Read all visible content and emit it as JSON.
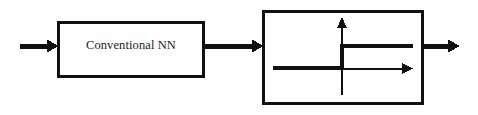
{
  "diagram": {
    "type": "block-diagram",
    "canvas": {
      "width": 478,
      "height": 115,
      "background": "#ffffff"
    },
    "stroke_color": "#111111",
    "blocks": [
      {
        "id": "nn-block",
        "label": "Conventional NN",
        "shape": "rectangle",
        "x": 57,
        "y": 21,
        "width": 148,
        "height": 57,
        "border_width": 3,
        "fill": "#ffffff",
        "border_color": "#111111"
      },
      {
        "id": "activation-block",
        "label": "",
        "shape": "rectangle",
        "x": 262,
        "y": 10,
        "width": 162,
        "height": 95,
        "border_width": 3,
        "fill": "#ffffff",
        "border_color": "#111111",
        "contains": "sign-step-function-plot"
      }
    ],
    "arrows": [
      {
        "id": "input-arrow",
        "name": "input-arrow",
        "x1": 20,
        "y1": 46,
        "x2": 57,
        "y2": 46,
        "stroke_width": 5,
        "head": "solid-triangle"
      },
      {
        "id": "interconnect-arrow",
        "name": "nn-to-activation-arrow",
        "x1": 205,
        "y1": 46,
        "x2": 262,
        "y2": 46,
        "stroke_width": 5,
        "head": "solid-triangle"
      },
      {
        "id": "output-arrow",
        "name": "output-arrow",
        "x1": 424,
        "y1": 46,
        "x2": 460,
        "y2": 46,
        "stroke_width": 5,
        "head": "solid-triangle"
      }
    ],
    "plot": {
      "id": "sign-step-function-plot",
      "name": "sign-step-function",
      "description": "Hard-limiter / signum activation: output is negative constant for x<0 and positive constant for x>0, with a discontinuous jump at the origin.",
      "origin": {
        "x": 342,
        "y": 68
      },
      "axes": {
        "vertical": {
          "x": 342,
          "y_top": 18,
          "y_bottom": 95,
          "stroke_width": 2,
          "arrow": "up"
        },
        "horizontal": {
          "y": 68,
          "x_left": 341,
          "x_right": 412,
          "stroke_width": 2,
          "arrow": "right"
        }
      },
      "curve": {
        "stroke_width": 4,
        "segments": [
          {
            "name": "lower-branch",
            "x1": 273,
            "y1": 68,
            "x2": 342,
            "y2": 68
          },
          {
            "name": "step-riser",
            "x1": 342,
            "y1": 68,
            "x2": 342,
            "y2": 46
          },
          {
            "name": "upper-branch",
            "x1": 342,
            "y1": 46,
            "x2": 413,
            "y2": 46
          }
        ]
      }
    }
  }
}
